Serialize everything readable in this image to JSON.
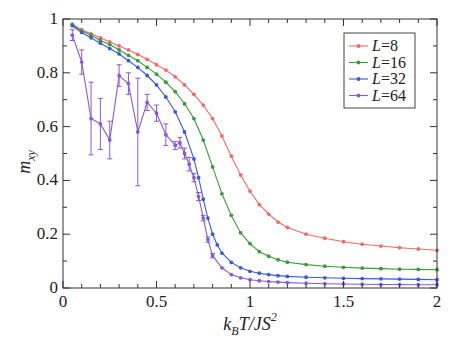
{
  "chart_data": {
    "type": "line",
    "title": "",
    "xlabel": "k_B T/JS^2",
    "ylabel": "m_xy",
    "xlim": [
      0,
      2
    ],
    "ylim": [
      0,
      1
    ],
    "xticks": [
      0,
      0.5,
      1,
      1.5,
      2
    ],
    "xtick_labels": [
      "0",
      "0.5",
      "1",
      "1.5",
      "2"
    ],
    "yticks": [
      0,
      0.2,
      0.4,
      0.6,
      0.8,
      1
    ],
    "ytick_labels": [
      "0",
      "0.2",
      "0.4",
      "0.6",
      "0.8",
      "1"
    ],
    "grid": false,
    "legend_position": "upper right",
    "series": [
      {
        "name": "L=8",
        "color": "#f06a6a",
        "x": [
          0.05,
          0.1,
          0.15,
          0.2,
          0.25,
          0.3,
          0.35,
          0.4,
          0.45,
          0.5,
          0.55,
          0.6,
          0.65,
          0.7,
          0.75,
          0.8,
          0.85,
          0.9,
          0.95,
          1.0,
          1.05,
          1.1,
          1.15,
          1.2,
          1.3,
          1.4,
          1.5,
          1.6,
          1.7,
          1.8,
          1.9,
          2.0
        ],
        "y": [
          0.98,
          0.96,
          0.945,
          0.93,
          0.915,
          0.9,
          0.885,
          0.868,
          0.85,
          0.83,
          0.81,
          0.785,
          0.755,
          0.72,
          0.68,
          0.63,
          0.565,
          0.49,
          0.42,
          0.36,
          0.31,
          0.275,
          0.245,
          0.225,
          0.2,
          0.185,
          0.172,
          0.163,
          0.156,
          0.15,
          0.145,
          0.14
        ]
      },
      {
        "name": "L=16",
        "color": "#3a9a3a",
        "x": [
          0.05,
          0.1,
          0.15,
          0.2,
          0.25,
          0.3,
          0.35,
          0.4,
          0.45,
          0.5,
          0.55,
          0.6,
          0.65,
          0.7,
          0.75,
          0.8,
          0.85,
          0.9,
          0.95,
          1.0,
          1.05,
          1.1,
          1.15,
          1.2,
          1.3,
          1.4,
          1.5,
          1.6,
          1.7,
          1.8,
          1.9,
          2.0
        ],
        "y": [
          0.98,
          0.955,
          0.94,
          0.92,
          0.905,
          0.885,
          0.865,
          0.845,
          0.82,
          0.795,
          0.765,
          0.73,
          0.685,
          0.63,
          0.55,
          0.45,
          0.35,
          0.27,
          0.205,
          0.165,
          0.135,
          0.118,
          0.105,
          0.096,
          0.087,
          0.081,
          0.077,
          0.074,
          0.072,
          0.07,
          0.069,
          0.068
        ]
      },
      {
        "name": "L=32",
        "color": "#3a5ad6",
        "x": [
          0.05,
          0.1,
          0.15,
          0.2,
          0.25,
          0.3,
          0.35,
          0.4,
          0.45,
          0.5,
          0.55,
          0.6,
          0.65,
          0.7,
          0.725,
          0.75,
          0.775,
          0.8,
          0.825,
          0.85,
          0.9,
          0.95,
          1.0,
          1.05,
          1.1,
          1.15,
          1.2,
          1.3,
          1.4,
          1.5,
          1.6,
          1.7,
          1.8,
          1.9,
          2.0
        ],
        "y": [
          0.975,
          0.95,
          0.93,
          0.91,
          0.89,
          0.87,
          0.845,
          0.82,
          0.79,
          0.755,
          0.71,
          0.655,
          0.58,
          0.48,
          0.41,
          0.33,
          0.26,
          0.2,
          0.16,
          0.13,
          0.095,
          0.075,
          0.062,
          0.055,
          0.05,
          0.046,
          0.043,
          0.04,
          0.038,
          0.036,
          0.035,
          0.034,
          0.033,
          0.032,
          0.031
        ]
      },
      {
        "name": "L=64",
        "color": "#8a5ad0",
        "x": [
          0.05,
          0.1,
          0.15,
          0.2,
          0.25,
          0.3,
          0.35,
          0.4,
          0.45,
          0.5,
          0.55,
          0.6,
          0.625,
          0.65,
          0.675,
          0.7,
          0.725,
          0.75,
          0.775,
          0.8,
          0.85,
          0.9,
          0.95,
          1.0,
          1.05,
          1.1,
          1.15,
          1.2,
          1.3,
          1.4,
          1.5,
          1.6,
          1.7,
          1.8,
          1.9,
          2.0
        ],
        "y": [
          0.94,
          0.84,
          0.63,
          0.61,
          0.55,
          0.79,
          0.76,
          0.58,
          0.69,
          0.65,
          0.57,
          0.53,
          0.54,
          0.5,
          0.46,
          0.41,
          0.34,
          0.26,
          0.18,
          0.12,
          0.075,
          0.05,
          0.038,
          0.031,
          0.027,
          0.024,
          0.022,
          0.02,
          0.018,
          0.016,
          0.015,
          0.014,
          0.013,
          0.013,
          0.012,
          0.012
        ],
        "yerr": [
          0.02,
          0.045,
          0.135,
          0.095,
          0.07,
          0.04,
          0.04,
          0.2,
          0.03,
          0.03,
          0.04,
          0.015,
          0.02,
          0.02,
          0.025,
          0.015,
          0.015,
          0.01,
          0.01,
          0.008,
          0.005,
          0.004,
          0.003,
          0.003,
          0.003,
          0.003,
          0.003,
          0.003,
          0.003,
          0.003,
          0.003,
          0.003,
          0.003,
          0.003,
          0.003,
          0.003
        ]
      }
    ]
  },
  "legend": {
    "items": [
      {
        "label": "L=8",
        "color": "#f06a6a"
      },
      {
        "label": "L=16",
        "color": "#3a9a3a"
      },
      {
        "label": "L=32",
        "color": "#3a5ad6"
      },
      {
        "label": "L=64",
        "color": "#8a5ad0"
      }
    ]
  },
  "axes": {
    "xlabel_main": "k",
    "xlabel_sub": "B",
    "xlabel_rest": "T/JS",
    "xlabel_sup": "2",
    "ylabel_main": "m",
    "ylabel_sub": "xy"
  }
}
